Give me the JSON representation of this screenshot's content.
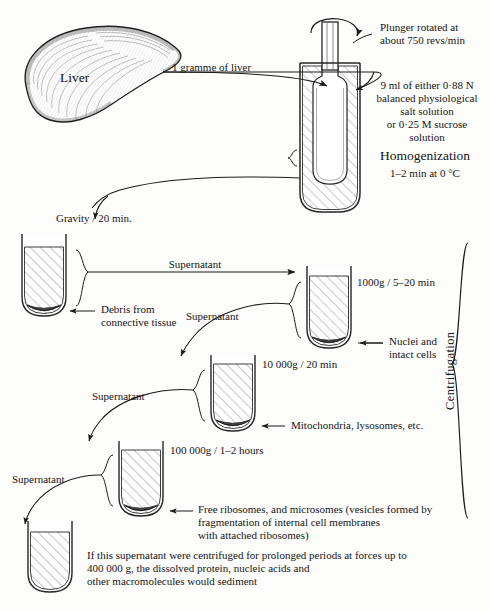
{
  "diagram": {
    "bracket_label": "Centrifugation"
  },
  "source": {
    "organ_label": "Liver",
    "transfer_label": "1 gramme of liver"
  },
  "homogenizer": {
    "plunger_note": "Plunger rotated at\nabout 750 revs/min",
    "medium_note": "9 ml of either 0·88 N\nbalanced physiological\nsalt solution\nor 0·25 M sucrose\nsolution",
    "process_label": "Homogenization",
    "process_conditions": "1–2 min at 0 °C"
  },
  "steps": [
    {
      "id": "gravity",
      "force_label": "Gravity / 20 min.",
      "pellet_label": "Debris from\nconnective tissue",
      "supernatant_label": "Supernatant"
    },
    {
      "id": "nuclei",
      "force_label": "1000g / 5–20 min",
      "pellet_label": "Nuclei and\nintact cells",
      "supernatant_label": "Supernatant"
    },
    {
      "id": "mitochondria",
      "force_label": "10 000g / 20 min",
      "pellet_label": "Mitochondria, lysosomes, etc.",
      "supernatant_label": "Supernatant"
    },
    {
      "id": "microsomes",
      "force_label": "100 000g / 1–2 hours",
      "pellet_label": "Free ribosomes, and microsomes (vesicles formed by\nfragmentation of internal cell membranes\nwith attached ribosomes)",
      "supernatant_label": "Supernatant"
    }
  ],
  "footnote": {
    "text": "If this supernatant were centrifuged for prolonged periods at forces up to\n400 000 g, the dissolved protein, nucleic acids and\nother macromolecules would sediment"
  },
  "colors": {
    "ink": "#1a1a1a",
    "hatch": "#8a8a8a",
    "glass": "#3a3a3a",
    "pellet": "#5c5c5c",
    "paper": "#fdfdfb"
  }
}
